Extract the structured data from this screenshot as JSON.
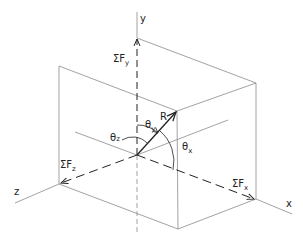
{
  "diagram": {
    "axes": {
      "x": "x",
      "y": "y",
      "z": "z"
    },
    "forces": {
      "sum_fx": {
        "sigma": "ΣF",
        "sub": "x"
      },
      "sum_fy": {
        "sigma": "ΣF",
        "sub": "y"
      },
      "sum_fz": {
        "sigma": "ΣF",
        "sub": "z"
      },
      "resultant": "R"
    },
    "angles": {
      "theta_x": {
        "sym": "θ",
        "sub": "x"
      },
      "theta_y": {
        "sym": "θ",
        "sub": "y"
      },
      "theta_z": {
        "sym": "θ",
        "sub": "z"
      }
    },
    "colors": {
      "line": "#8a8a8a",
      "ink": "#222222",
      "background": "#ffffff"
    }
  }
}
